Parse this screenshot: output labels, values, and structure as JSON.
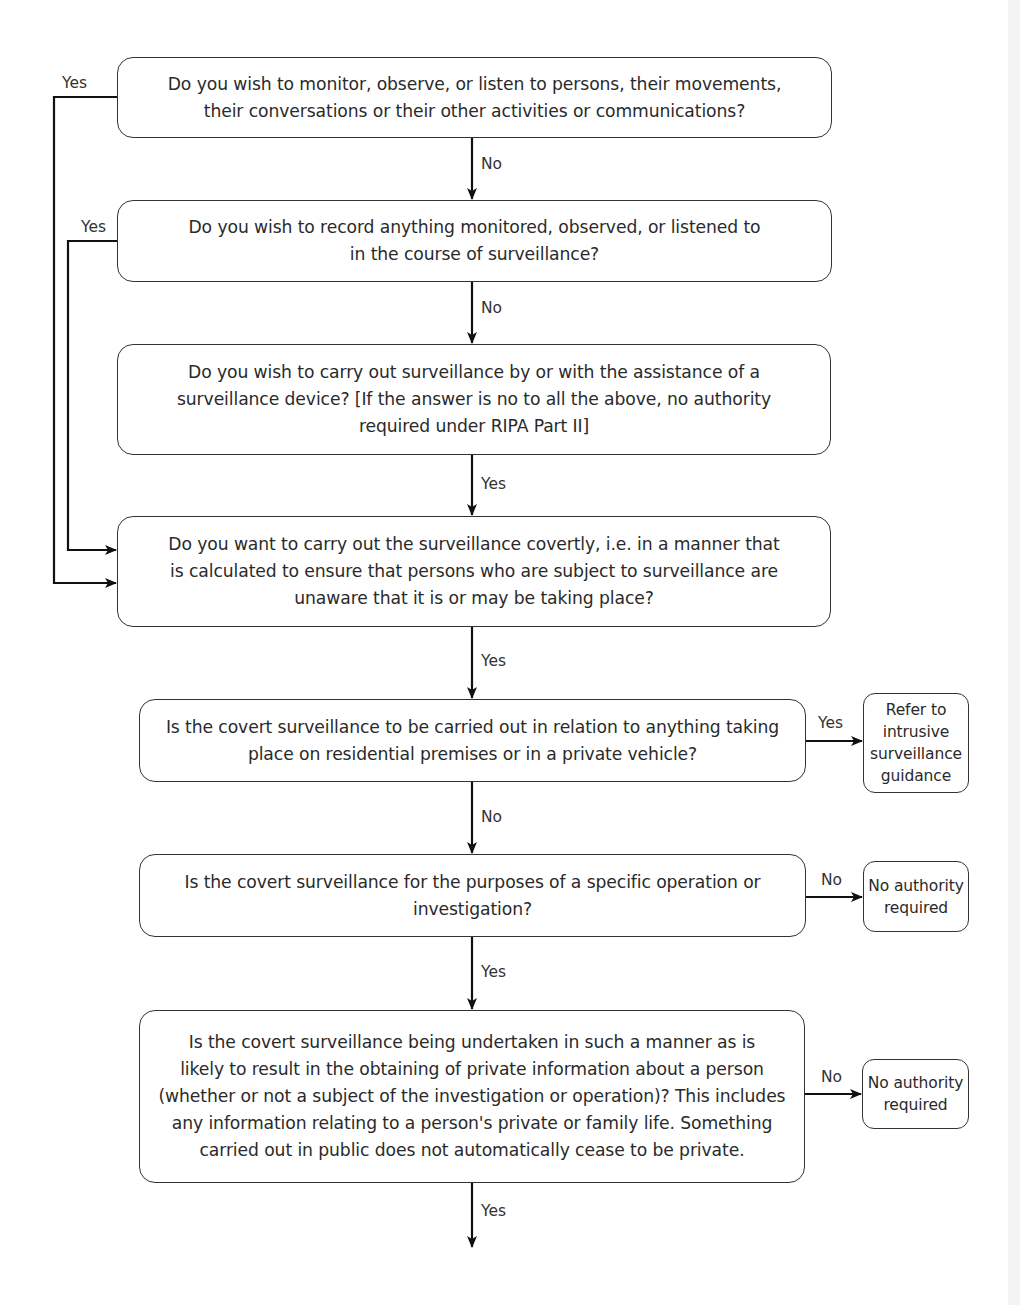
{
  "flowchart": {
    "questions": [
      {
        "id": "q1",
        "text": "Do you wish to monitor, observe, or listen to persons, their movements,\ntheir conversations or their other activities or communications?"
      },
      {
        "id": "q2",
        "text": "Do you wish to record anything monitored, observed, or listened to\nin the course of surveillance?"
      },
      {
        "id": "q3",
        "text": "Do you wish to carry out surveillance by or with the assistance of a\nsurveillance device? [If the answer is no to all the above, no authority\nrequired under RIPA Part II]"
      },
      {
        "id": "q4",
        "text": "Do you want to carry out the surveillance covertly, i.e. in a manner that\nis calculated to ensure that persons who are subject to surveillance are\nunaware that it is or may be taking place?"
      },
      {
        "id": "q5",
        "text": "Is the covert surveillance to be carried out in relation to anything taking\nplace on residential premises or in a private vehicle?"
      },
      {
        "id": "q6",
        "text": "Is the covert surveillance for the purposes of a specific operation or\ninvestigation?"
      },
      {
        "id": "q7",
        "text": "Is the covert surveillance being undertaken in such a manner as is\nlikely to result in the obtaining of private information about a person\n(whether or not a subject of the investigation or operation)? This includes\nany information relating to a person's private or family life. Something\ncarried out in public does not automatically cease to be private."
      }
    ],
    "outcomes": [
      {
        "id": "o1",
        "text": "Refer to\nintrusive\nsurveillance\nguidance"
      },
      {
        "id": "o2",
        "text": "No authority\nrequired"
      },
      {
        "id": "o3",
        "text": "No authority\nrequired"
      }
    ],
    "edge_labels": {
      "q1_yes": "Yes",
      "q1_no": "No",
      "q2_yes": "Yes",
      "q2_no": "No",
      "q3_yes": "Yes",
      "q4_yes": "Yes",
      "q5_yes": "Yes",
      "q5_no": "No",
      "q6_no": "No",
      "q6_yes": "Yes",
      "q7_no": "No",
      "q7_yes": "Yes"
    },
    "colors": {
      "line": "#111111",
      "border": "#333333",
      "text": "#2a2a2a",
      "background": "#ffffff"
    }
  }
}
